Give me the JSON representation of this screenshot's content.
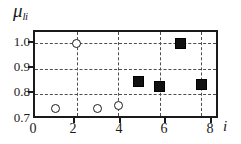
{
  "chart_data": {
    "type": "scatter",
    "title": "",
    "ylabel": "μ",
    "ylabel_sub": "li",
    "xlabel": "i",
    "xlim": [
      0,
      8.9
    ],
    "ylim": [
      0.7,
      1.045
    ],
    "grid": true,
    "grid_style": "dashed",
    "legend": "none",
    "xticks": [
      0,
      2,
      4,
      6,
      8
    ],
    "xtick_labels": [
      "0",
      "2",
      "4",
      "6",
      "8"
    ],
    "yticks": [
      0.7,
      0.8,
      0.9,
      1.0
    ],
    "ytick_labels": [
      "0.7",
      "0.8",
      "0.9",
      "1.0"
    ],
    "gridlines_y": [
      0.8,
      0.9,
      1.0
    ],
    "gridlines_x": [
      2,
      4,
      6,
      8
    ],
    "series": [
      {
        "name": "open-circles",
        "marker": "open-circle",
        "color": "#1a1a1a",
        "fill": "#ffffff",
        "x": [
          1,
          2,
          3,
          4
        ],
        "y": [
          0.745,
          1.0,
          0.745,
          0.755
        ]
      },
      {
        "name": "filled-squares",
        "marker": "filled-square",
        "color": "#111111",
        "fill": "#111111",
        "x": [
          5,
          6,
          7,
          8
        ],
        "y": [
          0.85,
          0.83,
          1.0,
          0.84
        ]
      }
    ]
  },
  "axis": {
    "frame_color": "#1a1a1a",
    "grid_color": "#4d4d4d",
    "background": "#ffffff"
  }
}
